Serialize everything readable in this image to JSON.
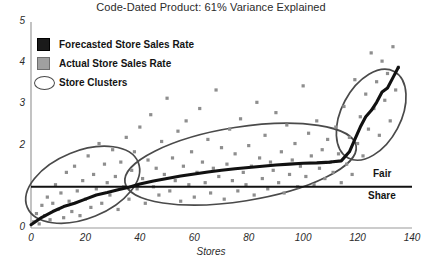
{
  "title": "Code-Dated Product: 61% Variance Explained",
  "legend": {
    "items": [
      {
        "label": "Forecasted Store Sales Rate",
        "marker": "black-square-icon",
        "color": "#1a1a1a"
      },
      {
        "label": "Actual Store Sales Rate",
        "marker": "gray-square-icon",
        "color": "#a0a0a0"
      },
      {
        "label": "Store Clusters",
        "marker": "ellipse-outline-icon",
        "color": "#4a4a4a"
      }
    ]
  },
  "annotations": {
    "fair": "Fair",
    "share": "Share",
    "reference_line_value": 1.0,
    "reference_line_color": "#111111"
  },
  "chart_data": {
    "type": "scatter",
    "title": "Code-Dated Product: 61% Variance Explained",
    "xlabel": "Stores",
    "ylabel": "",
    "xlim": [
      0,
      140
    ],
    "ylim": [
      0,
      5
    ],
    "xticks": [
      0,
      20,
      40,
      60,
      80,
      100,
      120,
      140
    ],
    "yticks": [
      0,
      1,
      2,
      3,
      4,
      5
    ],
    "ytick_labels": [
      "0",
      "",
      "2",
      "3",
      "4",
      "5"
    ],
    "grid": false,
    "legend_position": "upper-left",
    "series": [
      {
        "name": "Actual Store Sales Rate",
        "type": "scatter",
        "marker": "square",
        "color": "#8e8e8e",
        "points": [
          [
            1,
            0.15
          ],
          [
            2,
            0.35
          ],
          [
            3,
            0.1
          ],
          [
            4,
            0.55
          ],
          [
            5,
            0.3
          ],
          [
            6,
            0.75
          ],
          [
            7,
            0.2
          ],
          [
            8,
            0.6
          ],
          [
            9,
            1.05
          ],
          [
            10,
            0.45
          ],
          [
            11,
            0.85
          ],
          [
            12,
            0.25
          ],
          [
            13,
            1.35
          ],
          [
            14,
            0.65
          ],
          [
            15,
            0.4
          ],
          [
            16,
            1.5
          ],
          [
            17,
            0.9
          ],
          [
            18,
            0.3
          ],
          [
            19,
            1.15
          ],
          [
            20,
            0.7
          ],
          [
            21,
            1.75
          ],
          [
            22,
            0.5
          ],
          [
            23,
            1.3
          ],
          [
            24,
            0.95
          ],
          [
            25,
            2.05
          ],
          [
            26,
            0.6
          ],
          [
            27,
            1.55
          ],
          [
            28,
            1.1
          ],
          [
            29,
            0.8
          ],
          [
            30,
            1.9
          ],
          [
            31,
            1.25
          ],
          [
            32,
            0.45
          ],
          [
            33,
            1.6
          ],
          [
            34,
            1.0
          ],
          [
            35,
            2.2
          ],
          [
            36,
            0.7
          ],
          [
            37,
            1.4
          ],
          [
            38,
            1.85
          ],
          [
            39,
            0.95
          ],
          [
            40,
            2.45
          ],
          [
            41,
            1.2
          ],
          [
            42,
            0.6
          ],
          [
            43,
            1.65
          ],
          [
            44,
            2.75
          ],
          [
            45,
            1.0
          ],
          [
            46,
            1.45
          ],
          [
            47,
            0.8
          ],
          [
            48,
            2.1
          ],
          [
            49,
            1.3
          ],
          [
            50,
            3.15
          ],
          [
            51,
            0.9
          ],
          [
            52,
            1.7
          ],
          [
            53,
            1.15
          ],
          [
            54,
            2.35
          ],
          [
            55,
            0.65
          ],
          [
            56,
            1.5
          ],
          [
            57,
            2.6
          ],
          [
            58,
            1.05
          ],
          [
            59,
            1.85
          ],
          [
            60,
            0.75
          ],
          [
            61,
            1.35
          ],
          [
            62,
            2.9
          ],
          [
            63,
            1.6
          ],
          [
            64,
            1.1
          ],
          [
            65,
            2.15
          ],
          [
            66,
            0.85
          ],
          [
            67,
            1.45
          ],
          [
            68,
            3.35
          ],
          [
            69,
            1.25
          ],
          [
            70,
            1.95
          ],
          [
            71,
            0.7
          ],
          [
            72,
            1.55
          ],
          [
            73,
            2.4
          ],
          [
            74,
            1.15
          ],
          [
            75,
            1.8
          ],
          [
            76,
            0.9
          ],
          [
            77,
            2.65
          ],
          [
            78,
            1.35
          ],
          [
            79,
            1.05
          ],
          [
            80,
            2.0
          ],
          [
            81,
            1.5
          ],
          [
            82,
            0.8
          ],
          [
            83,
            3.05
          ],
          [
            84,
            1.7
          ],
          [
            85,
            1.2
          ],
          [
            86,
            2.25
          ],
          [
            87,
            0.95
          ],
          [
            88,
            1.6
          ],
          [
            89,
            1.4
          ],
          [
            90,
            2.8
          ],
          [
            91,
            1.1
          ],
          [
            92,
            1.85
          ],
          [
            93,
            0.85
          ],
          [
            94,
            2.5
          ],
          [
            95,
            1.3
          ],
          [
            96,
            1.65
          ],
          [
            97,
            2.05
          ],
          [
            98,
            1.0
          ],
          [
            99,
            1.5
          ],
          [
            100,
            3.45
          ],
          [
            101,
            1.25
          ],
          [
            102,
            2.3
          ],
          [
            103,
            1.75
          ],
          [
            104,
            1.05
          ],
          [
            105,
            2.6
          ],
          [
            106,
            1.45
          ],
          [
            107,
            1.9
          ],
          [
            108,
            1.2
          ],
          [
            109,
            2.15
          ],
          [
            110,
            1.6
          ],
          [
            111,
            1.35
          ],
          [
            112,
            2.45
          ],
          [
            113,
            1.8
          ],
          [
            114,
            1.1
          ],
          [
            115,
            2.95
          ],
          [
            116,
            1.55
          ],
          [
            117,
            2.2
          ],
          [
            118,
            1.3
          ],
          [
            119,
            3.6
          ],
          [
            120,
            2.05
          ],
          [
            121,
            2.7
          ],
          [
            122,
            1.75
          ],
          [
            123,
            3.25
          ],
          [
            124,
            2.4
          ],
          [
            125,
            4.25
          ],
          [
            126,
            2.9
          ],
          [
            127,
            3.55
          ],
          [
            128,
            2.25
          ],
          [
            129,
            4.05
          ],
          [
            130,
            3.1
          ],
          [
            131,
            3.75
          ],
          [
            132,
            2.6
          ],
          [
            133,
            4.4
          ],
          [
            134,
            3.35
          ],
          [
            135,
            3.9
          ]
        ]
      },
      {
        "name": "Forecasted Store Sales Rate",
        "type": "line",
        "color": "#111111",
        "points": [
          [
            0,
            0.08
          ],
          [
            4,
            0.26
          ],
          [
            8,
            0.4
          ],
          [
            12,
            0.52
          ],
          [
            16,
            0.6
          ],
          [
            20,
            0.7
          ],
          [
            24,
            0.8
          ],
          [
            28,
            0.86
          ],
          [
            32,
            0.93
          ],
          [
            36,
            0.99
          ],
          [
            40,
            1.07
          ],
          [
            45,
            1.14
          ],
          [
            50,
            1.2
          ],
          [
            55,
            1.26
          ],
          [
            60,
            1.31
          ],
          [
            65,
            1.36
          ],
          [
            70,
            1.4
          ],
          [
            75,
            1.44
          ],
          [
            80,
            1.47
          ],
          [
            85,
            1.5
          ],
          [
            90,
            1.53
          ],
          [
            95,
            1.55
          ],
          [
            100,
            1.57
          ],
          [
            105,
            1.58
          ],
          [
            110,
            1.6
          ],
          [
            114,
            1.63
          ],
          [
            117,
            1.85
          ],
          [
            119,
            2.15
          ],
          [
            121,
            2.45
          ],
          [
            123,
            2.7
          ],
          [
            125,
            2.85
          ],
          [
            127,
            3.05
          ],
          [
            129,
            3.3
          ],
          [
            131,
            3.4
          ],
          [
            133,
            3.65
          ],
          [
            135,
            3.9
          ]
        ]
      }
    ],
    "clusters": [
      {
        "name": "cluster-left",
        "cx": 19,
        "cy": 1.05,
        "rx": 22,
        "ry": 0.82,
        "rotation": -22
      },
      {
        "name": "cluster-middle",
        "cx": 77,
        "cy": 1.55,
        "rx": 43,
        "ry": 0.9,
        "rotation": -9
      },
      {
        "name": "cluster-right",
        "cx": 125,
        "cy": 2.75,
        "rx": 18,
        "ry": 0.72,
        "rotation": -62
      }
    ],
    "reference_lines": [
      {
        "name": "fair-share-line",
        "y": 1.0,
        "label": "Fair Share",
        "color": "#111111"
      }
    ]
  }
}
